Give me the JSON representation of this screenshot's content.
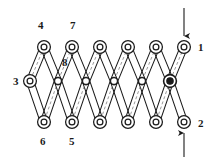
{
  "figure": {
    "width": 218,
    "height": 163,
    "background_color": "#ffffff",
    "line_color": "#1a1a1a",
    "dash_color": "#8f8f8f"
  },
  "labels": [
    {
      "id": "label-4",
      "text": "4",
      "x": 38,
      "y": 20
    },
    {
      "id": "label-7",
      "text": "7",
      "x": 70,
      "y": 20
    },
    {
      "id": "label-8",
      "text": "8",
      "x": 62,
      "y": 57
    },
    {
      "id": "label-3",
      "text": "3",
      "x": 13,
      "y": 76
    },
    {
      "id": "label-1",
      "text": "1",
      "x": 198,
      "y": 42
    },
    {
      "id": "label-2",
      "text": "2",
      "x": 198,
      "y": 118
    },
    {
      "id": "label-6",
      "text": "6",
      "x": 40,
      "y": 136
    },
    {
      "id": "label-5",
      "text": "5",
      "x": 69,
      "y": 136
    }
  ],
  "geometry": {
    "rows": {
      "top_y": 47,
      "mid_y": 81,
      "bottom_y": 122
    },
    "top_pivot_x": [
      44,
      72,
      100,
      128,
      156,
      184
    ],
    "bottom_pivot_x": [
      44,
      72,
      100,
      128,
      156,
      184
    ],
    "mid_small_x": [
      58,
      86,
      114,
      142
    ],
    "mid_left_x": 30,
    "mid_right_x": 170
  },
  "pivots": {
    "top": [
      {
        "name": "pivot-top-1",
        "x": 44,
        "y": 47,
        "style": "double-ring",
        "label": "4"
      },
      {
        "name": "pivot-top-2",
        "x": 72,
        "y": 47,
        "style": "double-ring",
        "label": "7"
      },
      {
        "name": "pivot-top-3",
        "x": 100,
        "y": 47,
        "style": "double-ring",
        "label": ""
      },
      {
        "name": "pivot-top-4",
        "x": 128,
        "y": 47,
        "style": "double-ring",
        "label": ""
      },
      {
        "name": "pivot-top-5",
        "x": 156,
        "y": 47,
        "style": "double-ring",
        "label": ""
      },
      {
        "name": "pivot-top-6",
        "x": 184,
        "y": 47,
        "style": "double-ring",
        "label": "1"
      }
    ],
    "middle": [
      {
        "name": "pivot-mid-ground",
        "x": 30,
        "y": 81,
        "style": "double-ring",
        "label": "3"
      },
      {
        "name": "pivot-mid-1",
        "x": 58,
        "y": 81,
        "style": "small-ring",
        "label": ""
      },
      {
        "name": "pivot-mid-2",
        "x": 86,
        "y": 81,
        "style": "small-ring",
        "label": ""
      },
      {
        "name": "pivot-mid-3",
        "x": 114,
        "y": 81,
        "style": "small-ring",
        "label": ""
      },
      {
        "name": "pivot-mid-4",
        "x": 142,
        "y": 81,
        "style": "small-ring",
        "label": ""
      },
      {
        "name": "pivot-mid-filled",
        "x": 170,
        "y": 81,
        "style": "filled-bullseye",
        "label": ""
      }
    ],
    "bottom": [
      {
        "name": "pivot-bottom-1",
        "x": 44,
        "y": 122,
        "style": "double-ring",
        "label": "6"
      },
      {
        "name": "pivot-bottom-2",
        "x": 72,
        "y": 122,
        "style": "double-ring",
        "label": "5"
      },
      {
        "name": "pivot-bottom-3",
        "x": 100,
        "y": 122,
        "style": "double-ring",
        "label": ""
      },
      {
        "name": "pivot-bottom-4",
        "x": 128,
        "y": 122,
        "style": "double-ring",
        "label": ""
      },
      {
        "name": "pivot-bottom-5",
        "x": 156,
        "y": 122,
        "style": "double-ring",
        "label": ""
      },
      {
        "name": "pivot-bottom-6",
        "x": 184,
        "y": 122,
        "style": "double-ring",
        "label": "2"
      }
    ]
  },
  "arrows": [
    {
      "name": "force-arrow-top",
      "direction": "down",
      "x": 184,
      "from_y": 8,
      "to_y": 36,
      "points_at": "1"
    },
    {
      "name": "force-arrow-bottom",
      "direction": "up",
      "x": 184,
      "from_y": 157,
      "to_y": 133,
      "points_at": "2"
    }
  ],
  "link_bars": {
    "description": "Capsule-outline rigid links joining pivot pairs in a scissor lattice",
    "half_width": 3.6
  },
  "dashed_lines": {
    "description": "Light grey dashed centrelines inside selected links",
    "count": 10
  }
}
